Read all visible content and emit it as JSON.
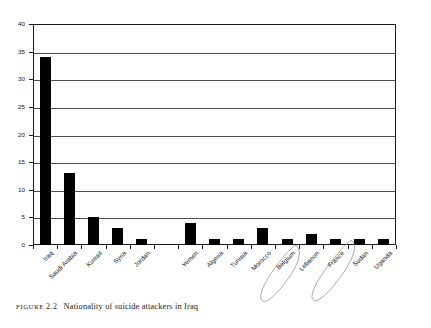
{
  "caption": {
    "figure_word": "FIGURE",
    "figure_number": "2.2",
    "text": "Nationality of suicide attackers in Iraq"
  },
  "chart_data": {
    "type": "bar",
    "title": "",
    "subtitle": "",
    "xlabel": "",
    "ylabel": "",
    "categories": [
      "Iraq",
      "Saudi Arabia",
      "Kuwait",
      "Syria",
      "Jordan",
      "",
      "Yemen",
      "Algeria",
      "Tunisia",
      "Morocco",
      "Belgium",
      "Lebanon",
      "France",
      "Sudan",
      "Uganda"
    ],
    "values": [
      34,
      13,
      5,
      3,
      1,
      0,
      4,
      1,
      1,
      3,
      1,
      2,
      1,
      1,
      1
    ],
    "ylim": [
      0,
      40
    ],
    "ytick_values": [
      0,
      5,
      10,
      15,
      20,
      25,
      30,
      35,
      40
    ],
    "ytick_labels": [
      "0",
      "5",
      "10",
      "15",
      "20",
      "25",
      "30",
      "35",
      "40"
    ],
    "grid": true,
    "grid_axis": "y",
    "legend": false,
    "legend_position": "none",
    "bar_color": "#000000",
    "gridline_color": "#4d4d4d",
    "axis_color": "#1a1a1a",
    "annotation_color": "#9a9a9a",
    "annotations": [
      {
        "label": "circled-belgium",
        "target": "Belgium",
        "shape": "hand-drawn-ellipse"
      },
      {
        "label": "circled-france",
        "target": "France",
        "shape": "hand-drawn-ellipse"
      }
    ]
  }
}
